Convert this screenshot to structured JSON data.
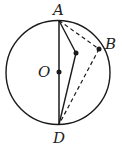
{
  "diagram": {
    "type": "geometry-circle",
    "labels": {
      "A": "A",
      "B": "B",
      "O": "O",
      "D": "D"
    },
    "colors": {
      "stroke": "#1a1a1a",
      "background": "#ffffff"
    },
    "points": {
      "A": [
        59,
        20
      ],
      "B": [
        99,
        49
      ],
      "O": [
        59,
        72
      ],
      "D": [
        59,
        125
      ],
      "P": [
        76,
        53
      ]
    },
    "circle": {
      "cx": 58,
      "cy": 72.5,
      "r": 52
    }
  }
}
